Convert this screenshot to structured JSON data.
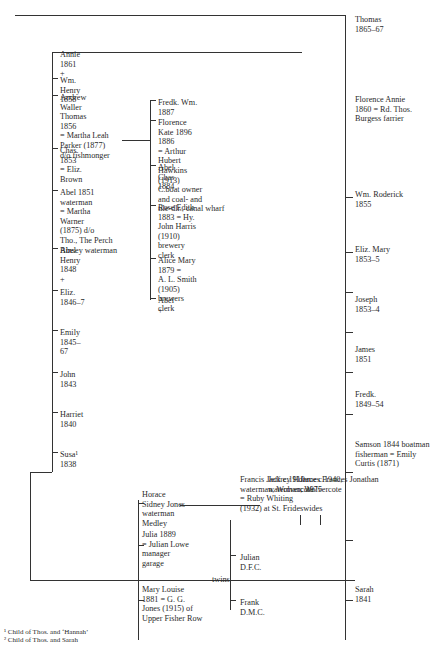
{
  "footnotes": [
    "¹ Child of Thos. and ‘Hannah’",
    "² Child of Thos. and Sarah"
  ],
  "generation_bottom": [
    {
      "lines": [
        "Sarah",
        "1841"
      ]
    },
    {
      "lines": [
        "Samson 1844 boatman",
        "fisherman = Emily",
        "Curtis (1871)"
      ]
    },
    {
      "lines": [
        "Fredk.",
        "1849–54"
      ]
    },
    {
      "lines": [
        "James",
        "1851"
      ]
    },
    {
      "lines": [
        "Joseph",
        "1853–4"
      ]
    },
    {
      "lines": [
        "Eliz. Mary",
        "1853–5"
      ]
    },
    {
      "lines": [
        "Wm. Roderick",
        "1855"
      ]
    },
    {
      "lines": [
        "Florence Annie",
        "1860 = Rd. Thos.",
        "Burgess farrier"
      ]
    },
    {
      "lines": [
        "Thomas",
        "1865–67"
      ]
    }
  ],
  "samson_children": [
    {
      "lines": [
        "Susa¹",
        "1838"
      ]
    },
    {
      "lines": [
        "Harriet",
        "1840"
      ]
    },
    {
      "lines": [
        "John",
        "1843"
      ]
    },
    {
      "lines": [
        "Emily",
        "1845–",
        "67"
      ]
    },
    {
      "lines": [
        "Eliz.",
        "1846–7"
      ]
    },
    {
      "lines": [
        "Abel",
        "Henry",
        "1848",
        "+"
      ]
    },
    {
      "lines": [
        "Abel 1851",
        "waterman",
        "= Martha",
        "Warner",
        "(1875) d/o",
        "Tho., The Perch",
        "Binsey waterman"
      ]
    },
    {
      "lines": [
        "Chas.",
        "1853",
        "= Eliz.",
        "Brown"
      ]
    },
    {
      "lines": [
        "Andrew",
        "Waller",
        "Thomas",
        "1856",
        "= Martha Leah",
        "Parker (1877)",
        "d/o fishmonger"
      ]
    },
    {
      "lines": [
        "Wm.",
        "Henry",
        "1858"
      ]
    },
    {
      "lines": [
        "Annie",
        "1861",
        "+"
      ]
    }
  ],
  "abel_children": [
    {
      "lines": [
        "Abel",
        "+"
      ]
    },
    {
      "lines": [
        "Alice Mary",
        "1879 =",
        "A. L. Smith",
        "(1905)",
        "brewers",
        "clerk"
      ]
    },
    {
      "lines": [
        "Rose Edith",
        "1883 = Hy.",
        "John Harris",
        "(1910)",
        "brewery",
        "clerk"
      ]
    },
    {
      "lines": [
        "Abel",
        "Chas",
        "1884"
      ]
    },
    {
      "lines": [
        "Florence",
        "Kate 1896",
        "1886",
        "= Arthur",
        "Hubert",
        "Hawkins",
        "(1913)",
        "C.boat owner",
        "and coal- and",
        "tile-dlr., canal wharf"
      ]
    },
    {
      "lines": [
        "Fredk. Wm.",
        "1887"
      ]
    }
  ],
  "mary_louise_line": [
    {
      "lines": [
        "Mary Louise",
        "1881 = G. G.",
        "Jones (1915) of",
        "Upper Fisher Row"
      ]
    },
    {
      "lines": [
        "Julia 1889",
        "= Julian Lowe",
        "manager",
        "garage"
      ]
    },
    {
      "lines": [
        "Horace",
        "Sidney Jones",
        "waterman",
        "Medley"
      ]
    }
  ],
  "twins_label": "twins",
  "twins": [
    {
      "lines": [
        "Frank",
        "D.M.C."
      ]
    },
    {
      "lines": [
        "Julian",
        "D.F.C."
      ]
    }
  ],
  "francis": {
    "lines": [
      "Francis Jack c.1910",
      "waterman, Wolvercote",
      "= Ruby Whiting",
      "(1932) at St. Frideswides"
    ]
  },
  "jeffrey": {
    "lines": [
      "Jeffrey Horace c.1940,",
      "waterman, Wolvercote"
    ]
  },
  "james": {
    "lines": [
      "James Frances Jonathan",
      "c.1975"
    ]
  }
}
